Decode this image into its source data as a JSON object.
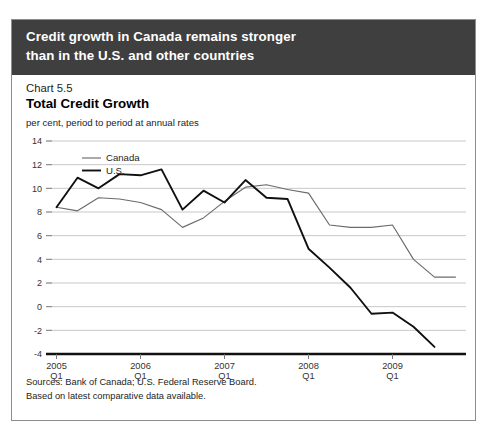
{
  "banner": {
    "line1": "Credit growth in Canada remains stronger",
    "line2": "than in the U.S. and other countries",
    "background": "#3f3f3f",
    "text_color": "#ffffff"
  },
  "chart_number": "Chart 5.5",
  "chart_title": "Total Credit Growth",
  "units": "per cent, period to period at annual rates",
  "legend": {
    "position": "top-left-inside",
    "entries": [
      {
        "label": "Canada",
        "color": "#6b6b6b",
        "width": 1.1
      },
      {
        "label": "U.S.",
        "color": "#101010",
        "width": 1.8
      }
    ]
  },
  "notes": {
    "line1": "Sources: Bank of Canada; U.S. Federal Reserve Board.",
    "line2": "Based on latest comparative data available."
  },
  "chart_data": {
    "type": "line",
    "title": "Total Credit Growth",
    "subtitle": "Chart 5.5",
    "xlabel": "",
    "ylabel": "per cent, period to period at annual rates",
    "ylim": [
      -4,
      14
    ],
    "yticks": [
      14,
      12,
      10,
      8,
      6,
      4,
      2,
      0,
      -2,
      -4
    ],
    "ytick_labels": [
      "14",
      "12",
      "10",
      "8",
      "6",
      "4",
      "2",
      "0",
      "-2",
      "-4"
    ],
    "grid": true,
    "grid_color": "#b9b9b9",
    "xtick_labels": [
      {
        "year": "2005",
        "quarter": "Q1"
      },
      {
        "year": "2006",
        "quarter": "Q1"
      },
      {
        "year": "2007",
        "quarter": "Q1"
      },
      {
        "year": "2008",
        "quarter": "Q1"
      },
      {
        "year": "2009",
        "quarter": "Q1"
      }
    ],
    "x": [
      "2005Q1",
      "2005Q2",
      "2005Q3",
      "2005Q4",
      "2006Q1",
      "2006Q2",
      "2006Q3",
      "2006Q4",
      "2007Q1",
      "2007Q2",
      "2007Q3",
      "2007Q4",
      "2008Q1",
      "2008Q2",
      "2008Q3",
      "2008Q4",
      "2009Q1",
      "2009Q2",
      "2009Q3",
      "2009Q4"
    ],
    "series": [
      {
        "name": "Canada",
        "color": "#6b6b6b",
        "values": [
          8.4,
          8.1,
          9.2,
          9.1,
          8.8,
          8.2,
          6.7,
          7.5,
          8.9,
          10.1,
          10.3,
          9.9,
          9.6,
          6.9,
          6.7,
          6.7,
          6.9,
          4.0,
          2.5,
          2.5
        ]
      },
      {
        "name": "U.S.",
        "color": "#101010",
        "values": [
          8.4,
          10.9,
          10.0,
          11.2,
          11.1,
          11.6,
          8.2,
          9.8,
          8.8,
          10.7,
          9.2,
          9.1,
          4.9,
          3.3,
          1.6,
          -0.6,
          -0.5,
          -1.7,
          -3.4,
          null
        ]
      }
    ]
  }
}
